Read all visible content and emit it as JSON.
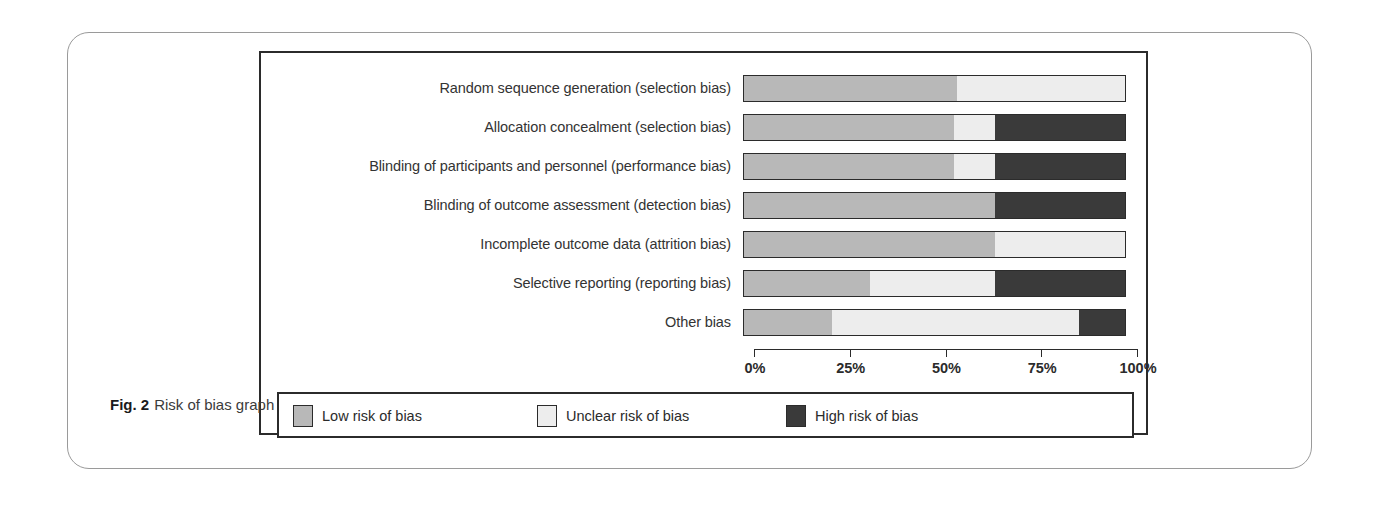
{
  "figure": {
    "caption_prefix": "Fig. 2",
    "caption_text": "Risk of bias graph"
  },
  "colors": {
    "low": "#b8b8b8",
    "unclear": "#ededed",
    "high": "#3a3a3a",
    "outline": "#2b2b2b",
    "card_border": "#9a9a9a",
    "background": "#ffffff"
  },
  "axis": {
    "ticks": [
      "0%",
      "25%",
      "50%",
      "75%",
      "100%"
    ],
    "tick_values": [
      0,
      25,
      50,
      75,
      100
    ]
  },
  "legend": {
    "items": [
      {
        "label": "Low risk of bias",
        "key": "low"
      },
      {
        "label": "Unclear risk of bias",
        "key": "unclear"
      },
      {
        "label": "High risk of bias",
        "key": "high"
      }
    ]
  },
  "chart_data": {
    "type": "bar",
    "orientation": "horizontal",
    "stacked": true,
    "percent": true,
    "title": "Risk of bias graph",
    "xlabel": "",
    "ylabel": "",
    "xlim": [
      0,
      100
    ],
    "grid": false,
    "legend_position": "bottom",
    "categories": [
      "Random sequence generation (selection bias)",
      "Allocation concealment (selection bias)",
      "Blinding of participants and personnel (performance bias)",
      "Blinding of outcome assessment (detection bias)",
      "Incomplete outcome data (attrition bias)",
      "Selective reporting (reporting bias)",
      "Other bias"
    ],
    "series": [
      {
        "name": "Low risk of bias",
        "color": "#b8b8b8",
        "values": [
          56,
          55,
          55,
          66,
          66,
          33,
          23
        ]
      },
      {
        "name": "Unclear risk of bias",
        "color": "#ededed",
        "values": [
          44,
          11,
          11,
          0,
          34,
          33,
          65
        ]
      },
      {
        "name": "High risk of bias",
        "color": "#3a3a3a",
        "values": [
          0,
          34,
          34,
          34,
          0,
          34,
          12
        ]
      }
    ]
  }
}
